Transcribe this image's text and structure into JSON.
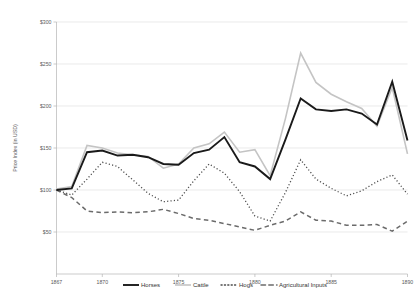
{
  "chart_data": {
    "type": "line",
    "title": "",
    "xlabel": "",
    "ylabel": "Price Index (in USD)",
    "x": [
      1867,
      1868,
      1869,
      1870,
      1871,
      1872,
      1873,
      1874,
      1875,
      1876,
      1877,
      1878,
      1879,
      1880,
      1881,
      1882,
      1883,
      1884,
      1885,
      1886,
      1887,
      1888,
      1889,
      1890
    ],
    "xlim": [
      1867,
      1890
    ],
    "ylim": [
      0,
      300
    ],
    "yticks": [
      0,
      50,
      100,
      150,
      200,
      250,
      300
    ],
    "ytick_labels": [
      "$0",
      "$50",
      "$100",
      "$150",
      "$200",
      "$250",
      "$300"
    ],
    "xticks": [
      1867,
      1870,
      1875,
      1880,
      1885,
      1890
    ],
    "xtick_labels": [
      "1867",
      "1870",
      "1875",
      "1880",
      "1885",
      "1890"
    ],
    "grid": true,
    "legend_position": "bottom",
    "series": [
      {
        "name": "Horses",
        "color": "#1a1a1a",
        "style": "solid",
        "width": 1.9,
        "values": [
          100,
          102,
          145,
          147,
          141,
          142,
          139,
          131,
          130,
          144,
          148,
          163,
          133,
          128,
          113,
          160,
          209,
          196,
          194,
          196,
          191,
          178,
          229,
          159
        ]
      },
      {
        "name": "Cattle",
        "color": "#c4c4c4",
        "style": "solid",
        "width": 1.6,
        "values": [
          101,
          104,
          153,
          150,
          144,
          142,
          140,
          126,
          131,
          150,
          155,
          169,
          145,
          148,
          117,
          185,
          263,
          228,
          214,
          205,
          197,
          176,
          222,
          143
        ]
      },
      {
        "name": "Hogs",
        "color": "#4d4d4d",
        "style": "dotted",
        "width": 1.3,
        "values": [
          100,
          94,
          113,
          133,
          128,
          112,
          96,
          86,
          88,
          111,
          131,
          120,
          98,
          69,
          63,
          97,
          136,
          113,
          102,
          93,
          99,
          110,
          118,
          95
        ]
      },
      {
        "name": "Agricultural Inputs",
        "color": "#6b6b6b",
        "style": "dashed",
        "width": 1.5,
        "values": [
          100,
          91,
          75,
          73,
          74,
          73,
          74,
          77,
          72,
          66,
          64,
          60,
          56,
          52,
          58,
          63,
          74,
          64,
          63,
          58,
          58,
          59,
          51,
          63
        ]
      }
    ]
  },
  "legend": {
    "items": [
      {
        "label": "Horses"
      },
      {
        "label": "Cattle"
      },
      {
        "label": "Hogs"
      },
      {
        "label": "Agricultural Inputs"
      }
    ]
  }
}
